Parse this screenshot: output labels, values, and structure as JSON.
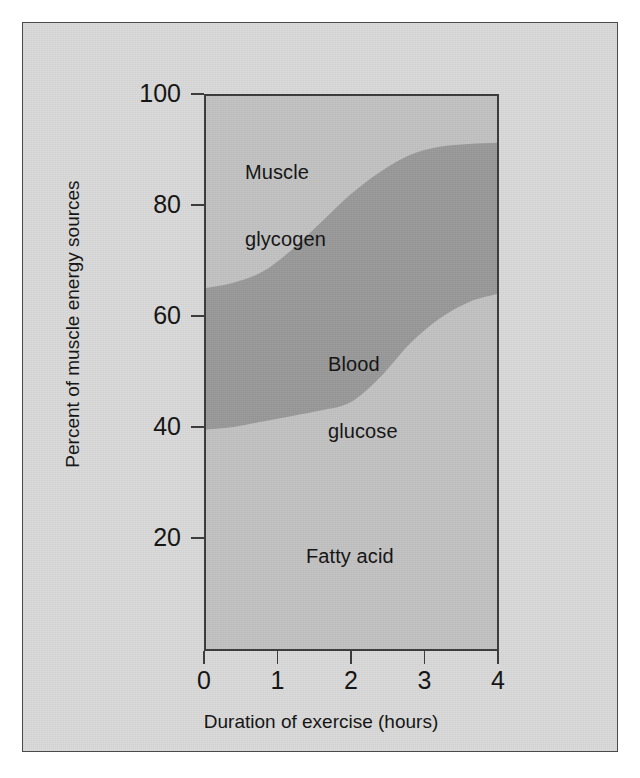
{
  "figure": {
    "background_color": "#d9d9d9",
    "frame_color": "#4a4a4a"
  },
  "chart_data": {
    "type": "area",
    "title": "",
    "subtitle": "",
    "xlabel": "Duration of exercise (hours)",
    "ylabel": "Percent of muscle energy sources",
    "xlim": [
      0,
      4
    ],
    "ylim": [
      0,
      100
    ],
    "grid": false,
    "legend_position": "inline-annotations",
    "plot_background_color": "#c2c2c2",
    "band_color": "#999999",
    "x_ticks": [
      0,
      1,
      2,
      3,
      4
    ],
    "x_tick_labels": [
      "0",
      "1",
      "2",
      "3",
      "4"
    ],
    "y_ticks": [
      20,
      40,
      60,
      80,
      100
    ],
    "y_tick_labels": [
      "20",
      "40",
      "60",
      "80",
      "100"
    ],
    "x": [
      0,
      0.4,
      0.8,
      1.2,
      1.6,
      2.0,
      2.4,
      2.8,
      3.2,
      3.6,
      4.0
    ],
    "series": [
      {
        "name": "Muscle glycogen",
        "role": "upper-region",
        "description": "Area above the upper boundary curve",
        "boundary_values": [
          65,
          66,
          68,
          72,
          77,
          82,
          86,
          89,
          90.5,
          91,
          91.2
        ]
      },
      {
        "name": "Blood glucose",
        "role": "middle-band",
        "description": "Shaded band between the lower and upper boundary curves",
        "upper_boundary_values": [
          65,
          66,
          68,
          72,
          77,
          82,
          86,
          89,
          90.5,
          91,
          91.2
        ],
        "lower_boundary_values": [
          39.5,
          40,
          41,
          42,
          43,
          44.5,
          49,
          55,
          59.5,
          62.5,
          64
        ]
      },
      {
        "name": "Fatty acid",
        "role": "lower-region",
        "description": "Area below the lower boundary curve",
        "boundary_values": [
          39.5,
          40,
          41,
          42,
          43,
          44.5,
          49,
          55,
          59.5,
          62.5,
          64
        ]
      }
    ],
    "annotations": [
      {
        "id": "muscle-glycogen",
        "text": "Muscle\nglycogen",
        "line1": "Muscle",
        "line2": "glycogen",
        "x": 0.35,
        "y": 90
      },
      {
        "id": "blood-glucose",
        "text": "Blood\nglucose",
        "line1": "Blood",
        "line2": "glucose",
        "x": 1.85,
        "y": 61
      },
      {
        "id": "fatty-acid",
        "text": "Fatty acid",
        "line1": "Fatty acid",
        "line2": "",
        "x": 1.7,
        "y": 26
      }
    ]
  }
}
